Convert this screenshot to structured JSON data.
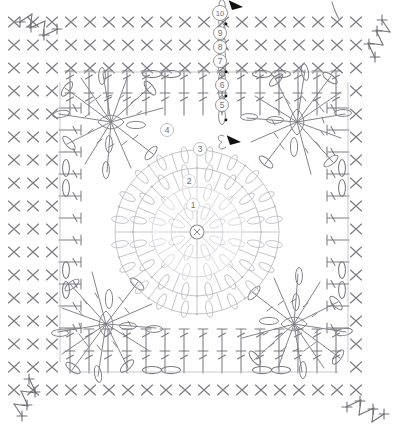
{
  "document": {
    "kind": "crochet-chart-diagram",
    "title": "Crochet granny square stitch chart",
    "width": 404,
    "height": 436,
    "background": "#ffffff"
  },
  "colors": {
    "background": "#ffffff",
    "stitch_dark": "#5a5a62",
    "stitch_mid": "#8a8a92",
    "stitch_light": "#b9b9c0",
    "stitch_faint": "#d2d2d8",
    "round_label_text": "#6e6e76",
    "round_label_stroke": "#9a9aa2",
    "marker_fill": "#111111",
    "grid_x_color": "#7b7b84"
  },
  "round_labels": [
    {
      "id": "round-1",
      "label": "1",
      "x": 193,
      "y": 205,
      "r": 6.5,
      "tone": "faint"
    },
    {
      "id": "round-2",
      "label": "2",
      "x": 189,
      "y": 181,
      "r": 6.5,
      "tone": "faint"
    },
    {
      "id": "round-3",
      "label": "3",
      "x": 200,
      "y": 149,
      "r": 6.5,
      "tone": "light"
    },
    {
      "id": "round-4",
      "label": "4",
      "x": 167,
      "y": 130,
      "r": 6.5,
      "tone": "light"
    },
    {
      "id": "round-5",
      "label": "5",
      "x": 222,
      "y": 105,
      "r": 6.5,
      "tone": "mid"
    },
    {
      "id": "round-6",
      "label": "6",
      "x": 222,
      "y": 85,
      "r": 6.5,
      "tone": "mid"
    },
    {
      "id": "round-7",
      "label": "7",
      "x": 220,
      "y": 61,
      "r": 6.5,
      "tone": "mid"
    },
    {
      "id": "round-8",
      "label": "8",
      "x": 220,
      "y": 47,
      "r": 6.5,
      "tone": "mid"
    },
    {
      "id": "round-9",
      "label": "9",
      "x": 220,
      "y": 33,
      "r": 6.5,
      "tone": "mid"
    },
    {
      "id": "round-10",
      "label": "10",
      "x": 220,
      "y": 13,
      "r": 7.5,
      "tone": "mid"
    }
  ],
  "center_symbol": {
    "name": "magic-ring",
    "label": "",
    "x": 197,
    "y": 232,
    "r": 7
  },
  "markers": [
    {
      "id": "start-marker-top",
      "name": "direction-arrow-top",
      "x": 232,
      "y": 10,
      "rotation": 150
    },
    {
      "id": "start-marker-mid",
      "name": "direction-arrow-inner",
      "x": 230,
      "y": 145,
      "rotation": 150
    }
  ],
  "yarn_tail": {
    "name": "yarn-tail-line",
    "description": "free yarn tail stroke at top right"
  },
  "legend_notes": {
    "x_stitch": "single crochet (sc)",
    "t_stitch": "double crochet (dc)",
    "oval": "puff / chain-loop",
    "leaf": "cluster",
    "plus": "picot"
  },
  "grid": {
    "x_rows": 17,
    "x_cols": 19,
    "cell_w": 19,
    "cell_h": 23,
    "x_glyph": "X"
  },
  "motifs": [
    {
      "id": "motif-top-left",
      "cx": 111,
      "cy": 122,
      "rotation": 0
    },
    {
      "id": "motif-top-right",
      "cx": 297,
      "cy": 122,
      "rotation": 90
    },
    {
      "id": "motif-bottom-left",
      "cx": 106,
      "cy": 324,
      "rotation": 270
    },
    {
      "id": "motif-bottom-right",
      "cx": 294,
      "cy": 324,
      "rotation": 180
    }
  ],
  "corner_picots": [
    {
      "id": "picot-top-left",
      "x": 34,
      "y": 34
    },
    {
      "id": "picot-top-right",
      "x": 370,
      "y": 34
    },
    {
      "id": "picot-bottom-left",
      "x": 34,
      "y": 402
    },
    {
      "id": "picot-bottom-right",
      "x": 370,
      "y": 402
    }
  ]
}
